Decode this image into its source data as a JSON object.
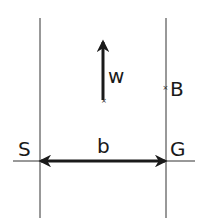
{
  "diagram": {
    "labels": {
      "weight": "w",
      "point_b": "B",
      "left_point": "S",
      "right_point": "G",
      "width": "b"
    },
    "colors": {
      "line": "#333333",
      "arrow": "#1a1a1a"
    }
  }
}
